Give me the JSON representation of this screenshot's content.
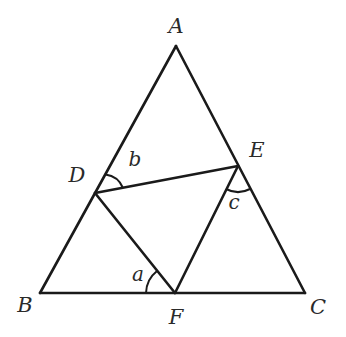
{
  "figure": {
    "points": {
      "A": {
        "label": "A"
      },
      "B": {
        "label": "B"
      },
      "C": {
        "label": "C"
      },
      "D": {
        "label": "D"
      },
      "E": {
        "label": "E"
      },
      "F": {
        "label": "F"
      }
    },
    "segments": [
      "AB",
      "BC",
      "CA",
      "DE",
      "EF",
      "FD"
    ],
    "angles": [
      {
        "label": "a",
        "vertex": "F",
        "between": [
          "B",
          "D"
        ]
      },
      {
        "label": "b",
        "vertex": "D",
        "between": [
          "A",
          "E"
        ]
      },
      {
        "label": "c",
        "vertex": "E",
        "between": [
          "F",
          "C"
        ]
      }
    ],
    "colors": {
      "stroke": "#1a1a1a",
      "text": "#2a2a2a",
      "background": "#ffffff"
    }
  }
}
